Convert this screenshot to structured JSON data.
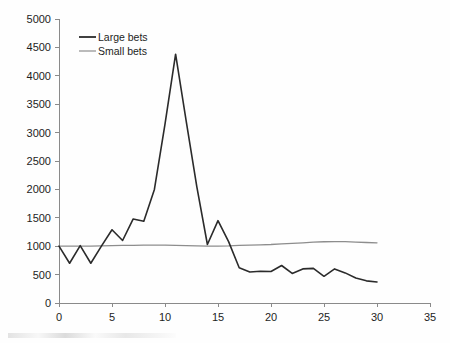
{
  "chart_data": {
    "type": "line",
    "title": "",
    "xlabel": "",
    "ylabel": "",
    "xlim": [
      0,
      35
    ],
    "ylim": [
      0,
      5000
    ],
    "grid": false,
    "legend_position": "top-left",
    "x_ticks": [
      0,
      5,
      10,
      15,
      20,
      25,
      30,
      35
    ],
    "y_ticks": [
      0,
      500,
      1000,
      1500,
      2000,
      2500,
      3000,
      3500,
      4000,
      4500,
      5000
    ],
    "x": [
      0,
      1,
      2,
      3,
      4,
      5,
      6,
      7,
      8,
      9,
      10,
      11,
      12,
      13,
      14,
      15,
      16,
      17,
      18,
      19,
      20,
      21,
      22,
      23,
      24,
      25,
      26,
      27,
      28,
      29,
      30
    ],
    "series": [
      {
        "name": "Large bets",
        "color": "#2b2b2b",
        "values": [
          1000,
          700,
          1010,
          700,
          1000,
          1290,
          1100,
          1480,
          1440,
          2000,
          3150,
          4380,
          3200,
          2050,
          1030,
          1450,
          1080,
          620,
          545,
          560,
          555,
          660,
          520,
          600,
          610,
          470,
          600,
          530,
          440,
          390,
          370
        ]
      },
      {
        "name": "Small bets",
        "color": "#8d8d8d",
        "values": [
          1000,
          1000,
          1000,
          1000,
          1005,
          1010,
          1015,
          1015,
          1020,
          1020,
          1020,
          1015,
          1010,
          1005,
          1000,
          1000,
          1005,
          1015,
          1020,
          1025,
          1030,
          1040,
          1050,
          1060,
          1070,
          1078,
          1082,
          1080,
          1072,
          1065,
          1060
        ]
      }
    ],
    "legend": [
      {
        "label": "Large bets",
        "style": "thick-dark"
      },
      {
        "label": "Small bets",
        "style": "thin-gray"
      }
    ],
    "y_tick_labels": [
      "5000",
      "4500",
      "4000",
      "3500",
      "3000",
      "2500",
      "2000",
      "1500",
      "1000",
      "500",
      "0"
    ],
    "x_tick_labels": [
      "0",
      "5",
      "10",
      "15",
      "20",
      "25",
      "30",
      "35"
    ]
  },
  "colors": {
    "large_bets": "#2b2b2b",
    "small_bets": "#8d8d8d",
    "axis": "#8a8a8a",
    "text": "#1d1d1d",
    "background": "#fefefe"
  }
}
